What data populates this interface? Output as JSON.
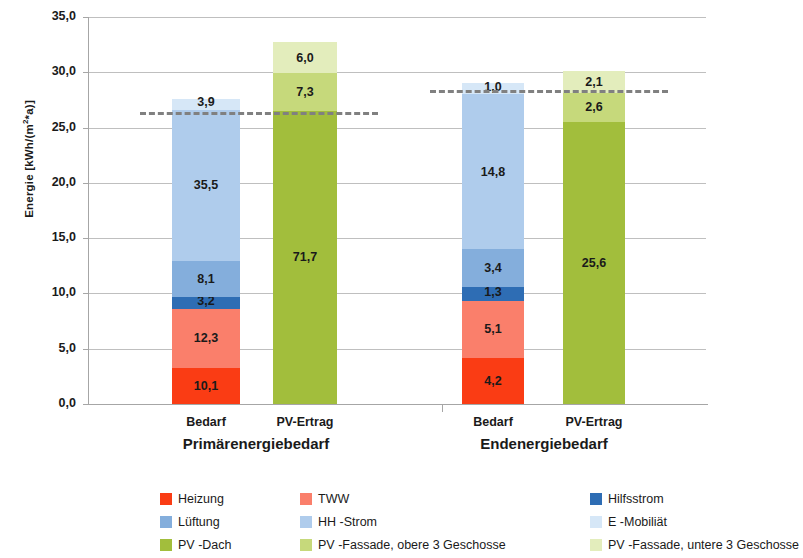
{
  "chart_data": {
    "type": "bar",
    "title": "",
    "xlabel": "",
    "ylabel": "Energie [kWh/(m²*a)]",
    "ylim": [
      0,
      35
    ],
    "ytick_labels": [
      "0,0",
      "5,0",
      "10,0",
      "15,0",
      "20,0",
      "25,0",
      "30,0",
      "35,0"
    ],
    "ytick_values": [
      0,
      5,
      10,
      15,
      20,
      25,
      30,
      35
    ],
    "grid": true,
    "stacked": true,
    "legend_position": "bottom",
    "groups": [
      {
        "name": "Primärenergiebedarf",
        "categories": [
          "Bedarf",
          "PV-Ertrag"
        ]
      },
      {
        "name": "Endenergiebedarf",
        "categories": [
          "Bedarf",
          "PV-Ertrag"
        ]
      }
    ],
    "series": [
      {
        "name": "Heizung",
        "color": "#FA3C14"
      },
      {
        "name": "TWW",
        "color": "#FA7F6B"
      },
      {
        "name": "Hilfsstrom",
        "color": "#2E6DB4"
      },
      {
        "name": "Lüftung",
        "color": "#84AEDC"
      },
      {
        "name": "HH -Strom",
        "color": "#AFCCEC"
      },
      {
        "name": "E -Mobiliät",
        "color": "#D6E7F7"
      },
      {
        "name": "PV -Dach",
        "color": "#A2BE3C"
      },
      {
        "name": "PV -Fassade, obere 3 Geschosse",
        "color": "#C6D97B"
      },
      {
        "name": "PV -Fassade, untere 3 Geschosse",
        "color": "#E3EDBC"
      }
    ],
    "bars": [
      {
        "id": "primaer-bedarf",
        "group": "Primärenergiebedarf",
        "category": "Bedarf",
        "total_height": 27.6,
        "segments": [
          {
            "series": "Heizung",
            "label": "10,1",
            "height": 3.3
          },
          {
            "series": "TWW",
            "label": "12,3",
            "height": 5.3
          },
          {
            "series": "Hilfsstrom",
            "label": "3,2",
            "height": 1.1
          },
          {
            "series": "Lüftung",
            "label": "8,1",
            "height": 3.2
          },
          {
            "series": "HH -Strom",
            "label": "35,5",
            "height": 13.7
          },
          {
            "series": "E -Mobiliät",
            "label": "3,9",
            "height": 1.0
          }
        ]
      },
      {
        "id": "primaer-pv",
        "group": "Primärenergiebedarf",
        "category": "PV-Ertrag",
        "total_height": 32.7,
        "segments": [
          {
            "series": "PV -Dach",
            "label": "71,7",
            "height": 26.5
          },
          {
            "series": "PV -Fassade, obere 3 Geschosse",
            "label": "7,3",
            "height": 3.4
          },
          {
            "series": "PV -Fassade, untere 3 Geschosse",
            "label": "6,0",
            "height": 2.8
          }
        ]
      },
      {
        "id": "end-bedarf",
        "group": "Endenergiebedarf",
        "category": "Bedarf",
        "total_height": 29.0,
        "segments": [
          {
            "series": "Heizung",
            "label": "4,2",
            "height": 4.2
          },
          {
            "series": "TWW",
            "label": "5,1",
            "height": 5.1
          },
          {
            "series": "Hilfsstrom",
            "label": "1,3",
            "height": 1.3
          },
          {
            "series": "Lüftung",
            "label": "3,4",
            "height": 3.4
          },
          {
            "series": "HH -Strom",
            "label": "14,8",
            "height": 14.0
          },
          {
            "series": "E -Mobiliät",
            "label": "1,0",
            "height": 1.0
          }
        ]
      },
      {
        "id": "end-pv",
        "group": "Endenergiebedarf",
        "category": "PV-Ertrag",
        "total_height": 30.1,
        "segments": [
          {
            "series": "PV -Dach",
            "label": "25,6",
            "height": 25.5
          },
          {
            "series": "PV -Fassade, obere 3 Geschosse",
            "label": "2,6",
            "height": 2.6
          },
          {
            "series": "PV -Fassade, untere 3 Geschosse",
            "label": "2,1",
            "height": 2.0
          }
        ]
      }
    ],
    "reference_lines": [
      {
        "id": "ref-primaer",
        "value": 26.4,
        "style": "dashed",
        "color": "#808080",
        "x_start": 140,
        "x_end": 378
      },
      {
        "id": "ref-end",
        "value": 28.4,
        "style": "dashed",
        "color": "#808080",
        "x_start": 430,
        "x_end": 668
      }
    ]
  },
  "legend": {
    "rows": [
      [
        {
          "label": "Heizung",
          "color": "#FA3C14"
        },
        {
          "label": "TWW",
          "color": "#FA7F6B"
        },
        {
          "label": "Hilfsstrom",
          "color": "#2E6DB4"
        }
      ],
      [
        {
          "label": "Lüftung",
          "color": "#84AEDC"
        },
        {
          "label": "HH -Strom",
          "color": "#AFCCEC"
        },
        {
          "label": "E -Mobiliät",
          "color": "#D6E7F7"
        }
      ],
      [
        {
          "label": "PV -Dach",
          "color": "#A2BE3C"
        },
        {
          "label": "PV -Fassade, obere 3 Geschosse",
          "color": "#C6D97B"
        },
        {
          "label": "PV -Fassade, untere 3 Geschosse",
          "color": "#E3EDBC"
        }
      ]
    ]
  }
}
